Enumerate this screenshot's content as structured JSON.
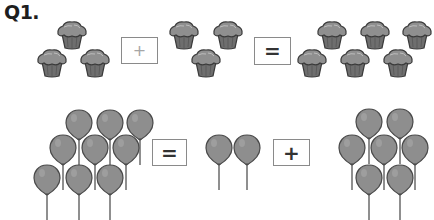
{
  "question": {
    "label": "Q1."
  },
  "colors": {
    "muffin_cap": "#8f8f8f",
    "muffin_cup": "#6e6e6e",
    "outline": "#3a3a3a",
    "balloon": "#8e8e8e",
    "balloon_outline": "#4a4a4a",
    "string": "#6a6a6a",
    "box_border": "#8a8a8a"
  },
  "row1": {
    "object": "muffin-icon",
    "groups": [
      {
        "count": 3,
        "positions": [
          [
            72,
            33
          ],
          [
            52,
            61
          ],
          [
            95,
            61
          ]
        ]
      },
      {
        "count": 3,
        "positions": [
          [
            184,
            33
          ],
          [
            228,
            33
          ],
          [
            206,
            61
          ]
        ]
      },
      {
        "count": 6,
        "positions": [
          [
            332,
            33
          ],
          [
            375,
            33
          ],
          [
            417,
            33
          ],
          [
            312,
            61
          ],
          [
            355,
            61
          ],
          [
            398,
            61
          ]
        ]
      }
    ],
    "operators": [
      {
        "symbol": "+",
        "box": [
          121,
          37,
          37,
          27
        ],
        "style": "light"
      },
      {
        "symbol": "=",
        "box": [
          254,
          37,
          37,
          28
        ],
        "style": "dark"
      }
    ]
  },
  "row2": {
    "object": "balloon-icon",
    "groups": [
      {
        "count": 9,
        "positions": [
          [
            79,
            125
          ],
          [
            110,
            125
          ],
          [
            140,
            125
          ],
          [
            63,
            150
          ],
          [
            95,
            150
          ],
          [
            126,
            150
          ],
          [
            47,
            180
          ],
          [
            79,
            180
          ],
          [
            110,
            180
          ]
        ]
      },
      {
        "count": 2,
        "positions": [
          [
            219,
            150
          ],
          [
            247,
            150
          ]
        ]
      },
      {
        "count": 7,
        "positions": [
          [
            369,
            124
          ],
          [
            400,
            124
          ],
          [
            352,
            150
          ],
          [
            384,
            150
          ],
          [
            415,
            150
          ],
          [
            369,
            180
          ],
          [
            400,
            180
          ]
        ]
      }
    ],
    "operators": [
      {
        "symbol": "=",
        "box": [
          152,
          139,
          35,
          27
        ],
        "style": "dark"
      },
      {
        "symbol": "+",
        "box": [
          273,
          139,
          37,
          27
        ],
        "style": "dark"
      }
    ]
  }
}
